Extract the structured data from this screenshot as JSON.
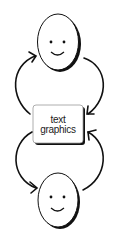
{
  "diagram": {
    "nodes": [
      {
        "id": "face-top",
        "type": "smiley-face"
      },
      {
        "id": "text-graphics-box",
        "type": "box",
        "label_lines": [
          "text",
          "graphics"
        ]
      },
      {
        "id": "face-bottom",
        "type": "smiley-face"
      }
    ],
    "edges": [
      {
        "from": "text-graphics-box",
        "to": "face-top",
        "side": "left"
      },
      {
        "from": "face-top",
        "to": "text-graphics-box",
        "side": "right"
      },
      {
        "from": "text-graphics-box",
        "to": "face-bottom",
        "side": "left"
      },
      {
        "from": "face-bottom",
        "to": "text-graphics-box",
        "side": "right"
      }
    ],
    "colors": {
      "stroke": "#111111",
      "background": "#ffffff",
      "shadow": "#111111"
    }
  }
}
